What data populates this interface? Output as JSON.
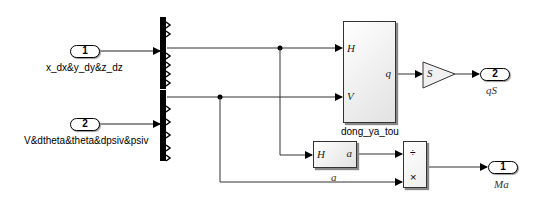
{
  "inports": [
    {
      "number": "1",
      "label": "x_dx&y_dy&z_dz"
    },
    {
      "number": "2",
      "label": "V&dtheta&theta&dpsiv&psiv"
    }
  ],
  "subsystems": {
    "dong_ya_tou": {
      "name": "dong_ya_tou",
      "inputs": [
        "H",
        "V"
      ],
      "output": "q"
    },
    "a": {
      "name": "a",
      "input": "H",
      "output": "a"
    }
  },
  "gain": {
    "value": "S"
  },
  "product": {
    "ops": [
      "÷",
      "×"
    ]
  },
  "outports": [
    {
      "number": "2",
      "label": "qS"
    },
    {
      "number": "1",
      "label": "Ma"
    }
  ],
  "colors": {
    "line": "#222222",
    "demux": "#000000",
    "block_fill": "#e8e8e8"
  }
}
